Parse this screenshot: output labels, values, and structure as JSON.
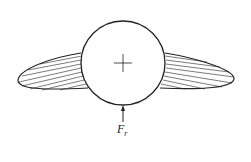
{
  "diagram": {
    "force_label": "F",
    "force_subscript": "r",
    "colors": {
      "stroke": "#222222",
      "background": "#ffffff"
    }
  }
}
